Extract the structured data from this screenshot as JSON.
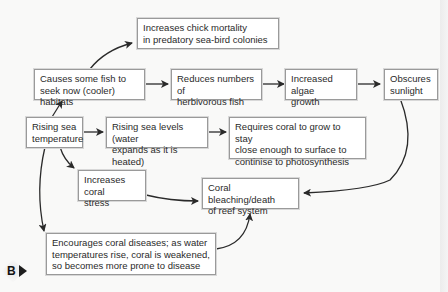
{
  "diagram": {
    "nodes": {
      "chick_mortality": "Increases chick mortality\nin predatory sea-bird colonies",
      "fish_habitats": "Causes some fish to\nseek now (cooler) habitats",
      "herbivorous_fish": "Reduces numbers of\nherbivorous fish",
      "algae_growth": "Increased algae\ngrowth",
      "obscures_sunlight": "Obscures\nsunlight",
      "rising_temp": "Rising sea\ntemperature",
      "rising_levels": "Rising sea levels (water\nexpands as it is heated)",
      "coral_grow": "Requires coral to grow to stay\nclose enough to surface to\ncontinise to photosynthesis",
      "coral_stress": "Increases coral\nstress",
      "bleaching": "Coral bleaching/death\nof reef system",
      "coral_diseases": "Encourages coral diseases; as water\ntemperatures rise, coral is weakened,\nso becomes more prone to disease"
    },
    "edges": [
      [
        "fish_habitats",
        "chick_mortality"
      ],
      [
        "fish_habitats",
        "herbivorous_fish"
      ],
      [
        "herbivorous_fish",
        "algae_growth"
      ],
      [
        "algae_growth",
        "obscures_sunlight"
      ],
      [
        "obscures_sunlight",
        "bleaching"
      ],
      [
        "rising_temp",
        "fish_habitats"
      ],
      [
        "rising_temp",
        "rising_levels"
      ],
      [
        "rising_levels",
        "coral_grow"
      ],
      [
        "rising_temp",
        "coral_stress"
      ],
      [
        "rising_temp",
        "coral_diseases"
      ],
      [
        "coral_stress",
        "bleaching"
      ],
      [
        "coral_diseases",
        "bleaching"
      ]
    ]
  },
  "marker": {
    "letter": "B"
  },
  "colors": {
    "box_border": "#9a9a9a",
    "arrow": "#2a2a2a",
    "background": "#f9f9f8"
  }
}
